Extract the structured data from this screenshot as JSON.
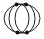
{
  "icon": {
    "name": "overlapping-circles-nodes",
    "stroke_color": "#222222",
    "node_color": "#111111",
    "background": "#ffffff",
    "outer_ellipse": {
      "cx": 22,
      "cy": 18.5,
      "rx": 18,
      "ry": 14.5
    },
    "inner_circles": [
      {
        "cx": 19,
        "cy": 18.5,
        "rx": 10,
        "ry": 14.5
      },
      {
        "cx": 25,
        "cy": 18.5,
        "rx": 10,
        "ry": 14.5
      }
    ],
    "nodes": [
      {
        "cx": 16.5,
        "cy": 4.5
      },
      {
        "cx": 26,
        "cy": 4.5
      },
      {
        "cx": 17.5,
        "cy": 32.5
      },
      {
        "cx": 27,
        "cy": 32.5
      }
    ]
  }
}
